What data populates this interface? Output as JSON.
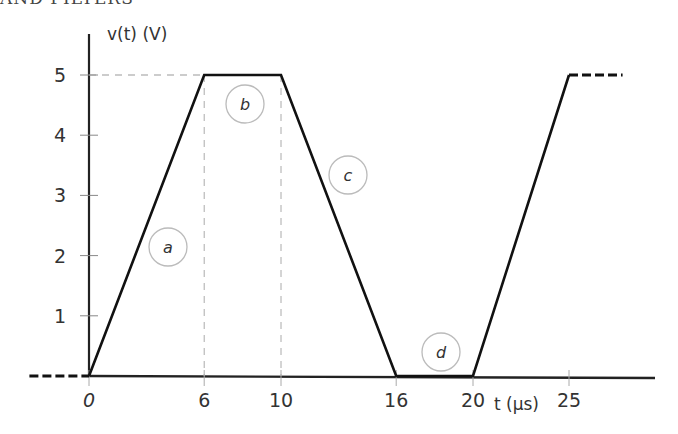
{
  "heading": {
    "text": "AND FILTERS"
  },
  "chart_data": {
    "type": "line",
    "title": "",
    "xlabel": "t (μs)",
    "ylabel": "v(t) (V)",
    "x_ticks": [
      0,
      6,
      10,
      16,
      20,
      25
    ],
    "y_ticks": [
      1,
      2,
      3,
      4,
      5
    ],
    "xlim": [
      -3,
      29
    ],
    "ylim": [
      0,
      5.5
    ],
    "grid": false,
    "legend": "none",
    "series": [
      {
        "name": "v(t)",
        "x": [
          0,
          6,
          10,
          16,
          20,
          25,
          28
        ],
        "y": [
          0,
          5,
          5,
          0,
          0,
          5,
          5
        ]
      }
    ],
    "continuation": {
      "left": {
        "x": [
          -3,
          0
        ],
        "y": [
          0,
          0
        ],
        "style": "dashed"
      },
      "right": {
        "x": [
          25,
          28
        ],
        "y": [
          5,
          5
        ],
        "style": "dashed"
      }
    },
    "reference_lines": [
      {
        "type": "horizontal",
        "y": 5,
        "from_x": 0,
        "to_x": 6,
        "style": "dashed"
      },
      {
        "type": "vertical",
        "x": 6,
        "from_y": 0,
        "to_y": 5,
        "style": "dashed"
      },
      {
        "type": "vertical",
        "x": 10,
        "from_y": 0,
        "to_y": 5,
        "style": "dashed"
      }
    ],
    "annotations": [
      {
        "label": "a",
        "x": 4,
        "y": 2.2,
        "segment": "rise 0–6 μs"
      },
      {
        "label": "b",
        "x": 7.8,
        "y": 4.6,
        "segment": "flat at 5 V, 6–10 μs"
      },
      {
        "label": "c",
        "x": 13.3,
        "y": 3.4,
        "segment": "fall 10–16 μs"
      },
      {
        "label": "d",
        "x": 18,
        "y": 0.4,
        "segment": "flat at 0 V, 16–20 μs"
      }
    ]
  }
}
